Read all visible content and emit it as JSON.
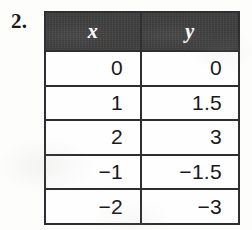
{
  "exercise": {
    "number_label": "2."
  },
  "table": {
    "name": "xy-value-table",
    "headers": {
      "x": "x",
      "y": "y"
    },
    "header_background": "#3b3b3c",
    "header_text_color": "#fdfdfd",
    "border_color": "#2e2e30",
    "cell_background": "#fefefe",
    "rows": [
      {
        "x": "0",
        "y": "0"
      },
      {
        "x": "1",
        "y": "1.5"
      },
      {
        "x": "2",
        "y": "3"
      },
      {
        "x": "−1",
        "y": "−1.5"
      },
      {
        "x": "−2",
        "y": "−3"
      }
    ]
  }
}
